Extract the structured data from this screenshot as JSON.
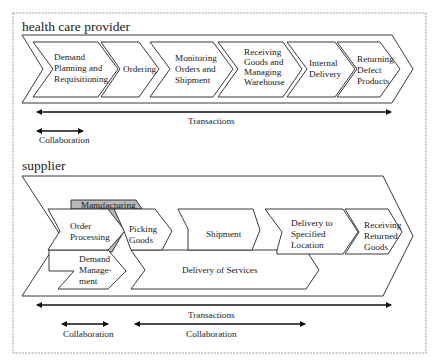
{
  "diagram": {
    "colors": {
      "stroke": "#222222",
      "highlight_fill": "#b8b8b8",
      "background": "#ffffff",
      "frame": "#9a9a9a"
    },
    "health_care_provider": {
      "title": "health care provider",
      "steps": [
        {
          "lines": [
            "Demand",
            "Planning and",
            "Requisitioning"
          ]
        },
        {
          "lines": [
            "Ordering"
          ]
        },
        {
          "lines": [
            "Monitoring",
            "Orders and",
            "Shipment"
          ]
        },
        {
          "lines": [
            "Receiving",
            "Goods and",
            "Managing",
            "Warehouse"
          ]
        },
        {
          "lines": [
            "Internal",
            "Delivery"
          ]
        },
        {
          "lines": [
            "Returning",
            "Defect",
            "Products"
          ]
        }
      ],
      "transactions_label": "Transactions",
      "collaboration_label": "Collaboration"
    },
    "supplier": {
      "title": "supplier",
      "manufacturing_label": "Manufacturing",
      "steps": [
        {
          "lines": [
            "Order",
            "Processing"
          ]
        },
        {
          "lines": [
            "Picking",
            "Goods"
          ]
        },
        {
          "lines": [
            "Shipment"
          ]
        },
        {
          "lines": [
            "Delivery to",
            "Specified",
            "Location"
          ]
        },
        {
          "lines": [
            "Receiving",
            "Returned",
            "Goods"
          ]
        }
      ],
      "lower_steps": [
        {
          "lines": [
            "Demand",
            "Manage-",
            "ment"
          ]
        },
        {
          "lines": [
            "Delivery of Services"
          ]
        }
      ],
      "transactions_label": "Transactions",
      "collaboration_labels": [
        "Collaboration",
        "Collaboration"
      ]
    }
  }
}
